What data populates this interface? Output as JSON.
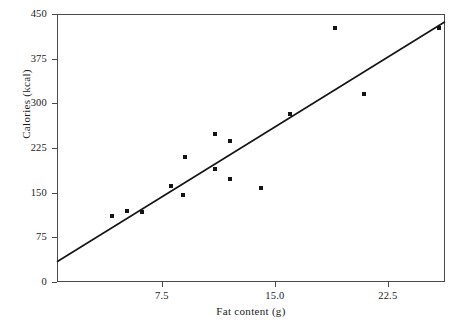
{
  "chart_data": {
    "type": "scatter",
    "title": "",
    "xlabel": "Fat content (g)",
    "ylabel": "Calories (kcal)",
    "xlim": [
      0.53,
      26.3
    ],
    "ylim": [
      0,
      450
    ],
    "xticks": [
      7.5,
      15.0,
      22.5
    ],
    "xtick_labels": [
      "7.5",
      "15.0",
      "22.5"
    ],
    "yticks": [
      0,
      75,
      150,
      225,
      300,
      375,
      450
    ],
    "ytick_labels": [
      "0",
      "75",
      "150",
      "225",
      "300",
      "375",
      "450"
    ],
    "grid": false,
    "legend": null,
    "marker_color": "#141414",
    "line_color": "#141414",
    "frame_color": "#4a4a4a",
    "background": "#ffffff",
    "points": [
      {
        "x": 4.2,
        "y": 111
      },
      {
        "x": 5.2,
        "y": 119
      },
      {
        "x": 6.2,
        "y": 118
      },
      {
        "x": 8.1,
        "y": 161
      },
      {
        "x": 9.0,
        "y": 210
      },
      {
        "x": 8.9,
        "y": 146
      },
      {
        "x": 11.0,
        "y": 248
      },
      {
        "x": 12.0,
        "y": 236
      },
      {
        "x": 11.0,
        "y": 190
      },
      {
        "x": 12.0,
        "y": 173
      },
      {
        "x": 14.1,
        "y": 158
      },
      {
        "x": 16.0,
        "y": 282
      },
      {
        "x": 19.0,
        "y": 427
      },
      {
        "x": 20.9,
        "y": 315
      },
      {
        "x": 25.9,
        "y": 427
      }
    ],
    "trend_line": {
      "type": "linear-fit",
      "x_start": 0.53,
      "y_start": 34,
      "x_end": 26.3,
      "y_end": 437
    }
  },
  "axes": {
    "y_title": "Calories (kcal)",
    "x_title": "Fat content (g)"
  }
}
